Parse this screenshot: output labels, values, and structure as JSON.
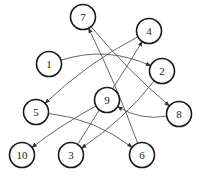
{
  "diagram": {
    "type": "directed-graph",
    "nodes": [
      {
        "id": "1",
        "label": "1"
      },
      {
        "id": "2",
        "label": "2"
      },
      {
        "id": "3",
        "label": "3"
      },
      {
        "id": "4",
        "label": "4"
      },
      {
        "id": "5",
        "label": "5"
      },
      {
        "id": "6",
        "label": "6"
      },
      {
        "id": "7",
        "label": "7"
      },
      {
        "id": "8",
        "label": "8"
      },
      {
        "id": "9",
        "label": "9"
      },
      {
        "id": "10",
        "label": "10"
      }
    ],
    "edges": [
      {
        "from": "1",
        "to": "2"
      },
      {
        "from": "7",
        "to": "8"
      },
      {
        "from": "6",
        "to": "7"
      },
      {
        "from": "3",
        "to": "4"
      },
      {
        "from": "4",
        "to": "5"
      },
      {
        "from": "2",
        "to": "3"
      },
      {
        "from": "8",
        "to": "9"
      },
      {
        "from": "9",
        "to": "10"
      },
      {
        "from": "5",
        "to": "6"
      }
    ],
    "colors": {
      "node_stroke": "#1a1a1a",
      "edge": "#555555",
      "background": "#ffffff"
    }
  }
}
